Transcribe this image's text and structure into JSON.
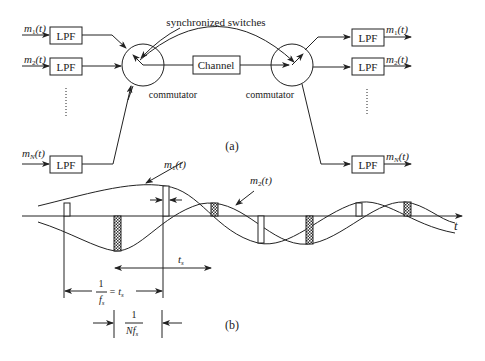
{
  "figure": {
    "part_a": {
      "label": "(a)",
      "inputs": [
        {
          "signal": "m",
          "sub": "1",
          "arg": "(t)",
          "block": "LPF"
        },
        {
          "signal": "m",
          "sub": "2",
          "arg": "(t)",
          "block": "LPF"
        },
        {
          "signal": "m",
          "sub": "N",
          "arg": "(t)",
          "block": "LPF"
        }
      ],
      "outputs": [
        {
          "signal": "m",
          "sub": "1",
          "arg": "(t)",
          "block": "LPF"
        },
        {
          "signal": "m",
          "sub": "2",
          "arg": "(t)",
          "block": "LPF"
        },
        {
          "signal": "m",
          "sub": "N",
          "arg": "(t)",
          "block": "LPF"
        }
      ],
      "left_commutator_label": "commutator",
      "right_commutator_label": "commutator",
      "channel_label": "Channel",
      "sync_label": "synchronized switches"
    },
    "part_b": {
      "label": "(b)",
      "axis_label": "t",
      "curve1_label": {
        "signal": "m",
        "sub": "1",
        "arg": "(t)"
      },
      "curve2_label": {
        "signal": "m",
        "sub": "2",
        "arg": "(t)"
      },
      "ts_label": {
        "signal": "t",
        "sub": "s"
      },
      "period_label": {
        "num": "1",
        "den": "f",
        "den_sub": "s",
        "eq": "= t",
        "eq_sub": "s"
      },
      "slot_label": {
        "num": "1",
        "den": "Nf",
        "den_sub": "s"
      }
    }
  }
}
